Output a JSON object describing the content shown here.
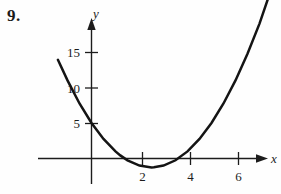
{
  "figure": {
    "problem_number": "9.",
    "background_color": "#fefefe",
    "ink_color": "#1c1c1c"
  },
  "chart_data": {
    "type": "line",
    "title": "",
    "subtitle": "",
    "xlabel": "x",
    "ylabel": "y",
    "curve_kind": "parabola",
    "equation": "y = x^2 - 5x + 5",
    "grid": false,
    "legend": null,
    "xlim": [
      -2.2,
      7.8
    ],
    "ylim": [
      -4,
      19
    ],
    "x_ticks": [
      2,
      4,
      6
    ],
    "x_tick_labels": [
      "2",
      "4",
      "6"
    ],
    "y_ticks": [
      5,
      10,
      15
    ],
    "y_tick_labels": [
      "5",
      "10",
      "15"
    ],
    "y_intercept": 5,
    "x_roots": [
      1.2,
      4.0
    ],
    "vertex": [
      2.6,
      -1.3
    ],
    "series": [
      {
        "name": "parabola",
        "x": [
          -1.4,
          -1.0,
          -0.5,
          0.0,
          0.5,
          1.0,
          1.2,
          1.5,
          2.0,
          2.5,
          2.6,
          3.0,
          3.5,
          4.0,
          4.5,
          5.0,
          5.5,
          6.0,
          6.5,
          7.0,
          7.4
        ],
        "y": [
          13.9,
          11.0,
          7.75,
          5.0,
          2.75,
          1.0,
          0.44,
          -0.25,
          -1.0,
          -1.25,
          -1.24,
          -1.0,
          -0.25,
          1.0,
          2.75,
          5.0,
          7.75,
          11.0,
          14.75,
          19.0,
          22.96
        ]
      }
    ],
    "axis_arrows": {
      "x": "right",
      "y": "up"
    }
  }
}
